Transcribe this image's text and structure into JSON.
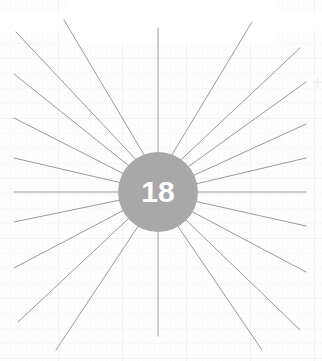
{
  "figure": {
    "type": "radial-burst",
    "hub_label": "18",
    "hub": {
      "cx": 158,
      "cy": 192,
      "r": 40,
      "fill": "#a8a8a8",
      "text_color": "#ffffff"
    },
    "ray_color": "#9a9a9a",
    "ray_width": 1,
    "ray_count": 18,
    "background": "#ffffff",
    "grid_color": "#f1f2f3",
    "bounds": {
      "left": 14,
      "top": 14,
      "right": 308,
      "bottom": 350
    },
    "rays": [
      {
        "index": 1,
        "angle_deg": -90,
        "end_x": 158,
        "end_y": 28
      },
      {
        "index": 2,
        "angle_deg": -70,
        "end_x": 252,
        "end_y": 22
      },
      {
        "index": 3,
        "angle_deg": -55,
        "end_x": 300,
        "end_y": 48
      },
      {
        "index": 4,
        "angle_deg": -40,
        "end_x": 306,
        "end_y": 82
      },
      {
        "index": 5,
        "angle_deg": -25,
        "end_x": 306,
        "end_y": 124
      },
      {
        "index": 6,
        "angle_deg": -12,
        "end_x": 306,
        "end_y": 158
      },
      {
        "index": 7,
        "angle_deg": 0,
        "end_x": 306,
        "end_y": 192
      },
      {
        "index": 8,
        "angle_deg": 14,
        "end_x": 306,
        "end_y": 226
      },
      {
        "index": 9,
        "angle_deg": 30,
        "end_x": 306,
        "end_y": 272
      },
      {
        "index": 10,
        "angle_deg": 45,
        "end_x": 300,
        "end_y": 330
      },
      {
        "index": 11,
        "angle_deg": 60,
        "end_x": 262,
        "end_y": 350
      },
      {
        "index": 12,
        "angle_deg": 90,
        "end_x": 158,
        "end_y": 336
      },
      {
        "index": 13,
        "angle_deg": 120,
        "end_x": 56,
        "end_y": 350
      },
      {
        "index": 14,
        "angle_deg": 138,
        "end_x": 18,
        "end_y": 322
      },
      {
        "index": 15,
        "angle_deg": 152,
        "end_x": 14,
        "end_y": 268
      },
      {
        "index": 16,
        "angle_deg": 168,
        "end_x": 14,
        "end_y": 222
      },
      {
        "index": 17,
        "angle_deg": 180,
        "end_x": 14,
        "end_y": 192
      },
      {
        "index": 18,
        "angle_deg": 194,
        "end_x": 14,
        "end_y": 158
      },
      {
        "index": 19,
        "angle_deg": 208,
        "end_x": 14,
        "end_y": 118
      },
      {
        "index": 20,
        "angle_deg": 222,
        "end_x": 14,
        "end_y": 74
      },
      {
        "index": 21,
        "angle_deg": 236,
        "end_x": 16,
        "end_y": 32
      },
      {
        "index": 22,
        "angle_deg": 250,
        "end_x": 64,
        "end_y": 20
      }
    ],
    "corner_marker": {
      "glyph": "✛",
      "x": 312,
      "y": 76,
      "color": "#ededed"
    }
  }
}
